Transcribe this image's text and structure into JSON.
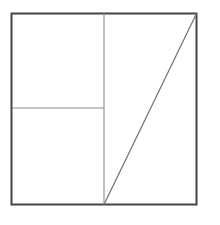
{
  "figure": {
    "title": "",
    "background_color": "#ffffff",
    "canvas": {
      "width": 220,
      "height": 225
    },
    "outer_square": {
      "name": "outer-square",
      "x": 11.5,
      "y": 13.5,
      "width": 185,
      "height": 191,
      "stroke_color": "#454545",
      "stroke_width": 2,
      "fill": "none"
    },
    "interior_lines": [
      {
        "name": "vertical-divider",
        "label": "vertical line",
        "x1": 104,
        "y1": 13.5,
        "x2": 104,
        "y2": 204.5,
        "stroke_color": "#8a8a8a",
        "stroke_width": 1.1
      },
      {
        "name": "horizontal-divider",
        "label": "horizontal line",
        "x1": 12,
        "y1": 108,
        "x2": 104,
        "y2": 108,
        "stroke_color": "#8a8a8a",
        "stroke_width": 1.1
      },
      {
        "name": "diagonal-line",
        "label": "diagonal line",
        "x1": 104,
        "y1": 204.5,
        "x2": 196.5,
        "y2": 13.5,
        "stroke_color": "#6f6f6f",
        "stroke_width": 1.2
      }
    ],
    "vertices": [
      {
        "name": "top-left-corner",
        "x": 11.5,
        "y": 13.5
      },
      {
        "name": "top-right-corner",
        "x": 196.5,
        "y": 13.5
      },
      {
        "name": "bottom-right-corner",
        "x": 196.5,
        "y": 204.5
      },
      {
        "name": "bottom-left-corner",
        "x": 11.5,
        "y": 204.5
      },
      {
        "name": "vertical-divider-top",
        "x": 104,
        "y": 13.5
      },
      {
        "name": "vertical-divider-bottom",
        "x": 104,
        "y": 204.5
      },
      {
        "name": "horizontal-divider-left",
        "x": 11.5,
        "y": 108
      },
      {
        "name": "horizontal-divider-right",
        "x": 104,
        "y": 108
      }
    ],
    "regions": [
      {
        "name": "region-top-left",
        "shape": "rectangle"
      },
      {
        "name": "region-bottom-left",
        "shape": "rectangle"
      },
      {
        "name": "region-upper-right-triangle",
        "shape": "triangle"
      },
      {
        "name": "region-lower-right-triangle",
        "shape": "triangle"
      }
    ]
  }
}
